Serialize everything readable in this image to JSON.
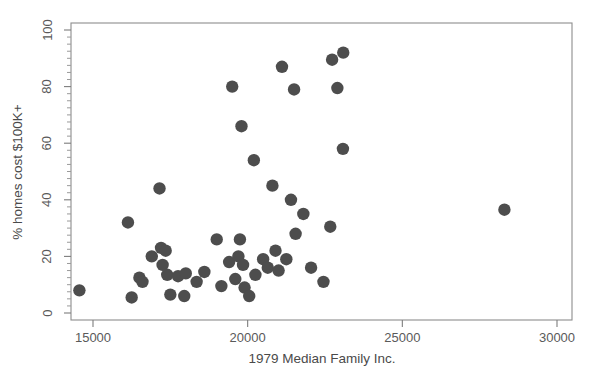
{
  "figure": {
    "width": 593,
    "height": 385,
    "background": "#ffffff",
    "point_color": "#4d4d4d",
    "axis_color": "#8d8d8d",
    "text_color": "#5a5a5a"
  },
  "chart_data": {
    "type": "scatter",
    "title": "",
    "xlabel": "1979 Median Family Inc.",
    "ylabel": "% homes cost $100K+",
    "xlim": [
      14000,
      30400
    ],
    "ylim": [
      0,
      103
    ],
    "xticks": [
      15000,
      20000,
      25000,
      30000
    ],
    "xtick_labels": [
      "15000",
      "20000",
      "25000",
      "30000"
    ],
    "yticks": [
      0,
      20,
      40,
      60,
      80,
      100
    ],
    "ytick_labels": [
      "0",
      "20",
      "40",
      "60",
      "80",
      "100"
    ],
    "x_minor_tick_count": 0,
    "y_minor_tick_step": 2.5,
    "grid": false,
    "legend": null,
    "marker": "circle",
    "marker_size": 6.2,
    "points": [
      {
        "x": 14560,
        "y": 8
      },
      {
        "x": 16130,
        "y": 32
      },
      {
        "x": 16250,
        "y": 5.5
      },
      {
        "x": 16500,
        "y": 12.5
      },
      {
        "x": 16600,
        "y": 11
      },
      {
        "x": 16900,
        "y": 20
      },
      {
        "x": 17150,
        "y": 44
      },
      {
        "x": 17200,
        "y": 23
      },
      {
        "x": 17250,
        "y": 17
      },
      {
        "x": 17350,
        "y": 22
      },
      {
        "x": 17400,
        "y": 13.5
      },
      {
        "x": 17500,
        "y": 6.5
      },
      {
        "x": 17750,
        "y": 13
      },
      {
        "x": 17950,
        "y": 6
      },
      {
        "x": 18000,
        "y": 14
      },
      {
        "x": 18350,
        "y": 11
      },
      {
        "x": 18600,
        "y": 14.5
      },
      {
        "x": 19000,
        "y": 26
      },
      {
        "x": 19150,
        "y": 9.5
      },
      {
        "x": 19400,
        "y": 18
      },
      {
        "x": 19500,
        "y": 80
      },
      {
        "x": 19600,
        "y": 12
      },
      {
        "x": 19700,
        "y": 20
      },
      {
        "x": 19750,
        "y": 26
      },
      {
        "x": 19800,
        "y": 66
      },
      {
        "x": 19850,
        "y": 17
      },
      {
        "x": 19900,
        "y": 9
      },
      {
        "x": 20050,
        "y": 6
      },
      {
        "x": 20200,
        "y": 54
      },
      {
        "x": 20250,
        "y": 13.5
      },
      {
        "x": 20500,
        "y": 19
      },
      {
        "x": 20650,
        "y": 16
      },
      {
        "x": 20800,
        "y": 45
      },
      {
        "x": 20900,
        "y": 22
      },
      {
        "x": 21000,
        "y": 15
      },
      {
        "x": 21110,
        "y": 87
      },
      {
        "x": 21250,
        "y": 19
      },
      {
        "x": 21400,
        "y": 40
      },
      {
        "x": 21500,
        "y": 79
      },
      {
        "x": 21550,
        "y": 28
      },
      {
        "x": 21800,
        "y": 35
      },
      {
        "x": 22050,
        "y": 16
      },
      {
        "x": 22450,
        "y": 11
      },
      {
        "x": 22670,
        "y": 30.5
      },
      {
        "x": 22730,
        "y": 89.5
      },
      {
        "x": 22900,
        "y": 79.5
      },
      {
        "x": 23080,
        "y": 58
      },
      {
        "x": 23090,
        "y": 92
      },
      {
        "x": 28300,
        "y": 36.5
      }
    ]
  }
}
